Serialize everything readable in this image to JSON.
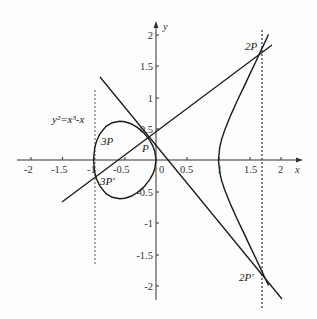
{
  "figure": {
    "equation": "y²=x³-x",
    "axis_labels": {
      "x": "x",
      "y": "y"
    },
    "x_ticks": [
      "-2",
      "-1.5",
      "-1",
      "-0.5",
      "0",
      "0.5",
      "1",
      "1.5",
      "2"
    ],
    "y_ticks": [
      "2",
      "1.5",
      "1",
      "0.5",
      "-0.5",
      "-1",
      "-1.5",
      "-2"
    ],
    "points": {
      "P": "P",
      "three_p": "3P",
      "three_p_prime": "3P′",
      "two_p": "2P",
      "two_p_prime": "2P′"
    },
    "colors": {
      "curve": "#1a1a1a",
      "axis": "#333333",
      "dotted": "#444444"
    }
  }
}
